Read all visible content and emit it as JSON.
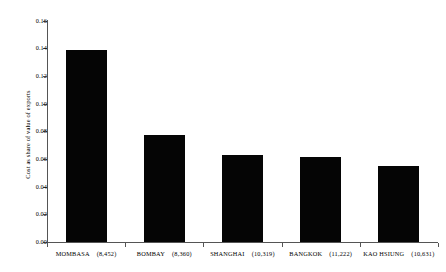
{
  "chart_data": {
    "type": "bar",
    "title": "",
    "subtitle": "",
    "xlabel": "",
    "ylabel": "Cost as share of value of exports",
    "ylim": [
      0.0,
      0.16
    ],
    "grid": false,
    "legend": null,
    "categories": [
      "MOMBASA",
      "BOMBAY",
      "SHANGHAI",
      "BANGKOK",
      "KAO HSIUNG"
    ],
    "category_values": [
      "(8,452)",
      "(8,360)",
      "(10,319)",
      "(11,222)",
      "(10,631)"
    ],
    "values": [
      0.1385,
      0.0775,
      0.063,
      0.0615,
      0.055
    ],
    "ytick_labels": [
      "0.16",
      "0.14",
      "0.12",
      "0.10",
      "0.08",
      "0.06",
      "0.04",
      "0.02",
      "0.00"
    ],
    "ytick_values": [
      0.16,
      0.14,
      0.12,
      0.1,
      0.08,
      0.06,
      0.04,
      0.02,
      0.0
    ],
    "bar_color": "#050505",
    "axis_color": "#555555",
    "background_color": "#ffffff"
  }
}
